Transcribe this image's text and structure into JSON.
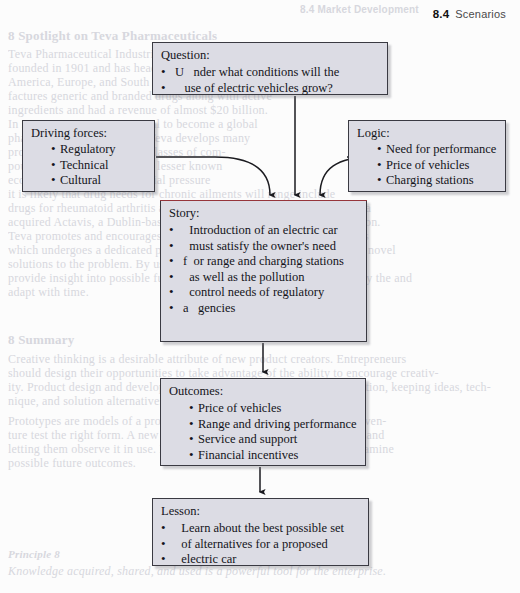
{
  "page": {
    "running_head": {
      "number": "8.4",
      "title": "Scenarios"
    },
    "background_color": "#fcfcfc",
    "node_fill_color": "#dcdce4",
    "node_border_color": "#3a3a42",
    "accent_rule_color": "#b5343a"
  },
  "diagram": {
    "type": "flowchart",
    "nodes": [
      {
        "id": "question",
        "title": "Question:",
        "lines": [
          "U   nder what conditions will the",
          "   use of electric vehicles grow?"
        ]
      },
      {
        "id": "driving-forces",
        "title": "Driving forces:",
        "bullets": [
          "Regulatory",
          "Technical",
          "Cultural"
        ]
      },
      {
        "id": "logic",
        "title": "Logic:",
        "bullets": [
          "Need for performance",
          "Price of vehicles",
          "Charging stations"
        ]
      },
      {
        "id": "story",
        "title": "Story:",
        "lines": [
          "  Introduction of an electric car",
          "  must satisfy the owner's need",
          "f  or range and charging stations",
          "  as well as the pollution",
          "  control needs of regulatory",
          "a   gencies"
        ]
      },
      {
        "id": "outcomes",
        "title": "Outcomes:",
        "bullets": [
          "Price of vehicles",
          "Range and driving performance",
          "Service and support",
          "Financial incentives"
        ]
      },
      {
        "id": "lesson",
        "title": "Lesson:",
        "lines": [
          "  Learn about the best possible set",
          "  of alternatives for a proposed",
          "  electric car"
        ]
      }
    ],
    "edges": [
      {
        "from": "question",
        "to": "story",
        "style": "straight-arrow-down"
      },
      {
        "from": "driving-forces",
        "to": "story",
        "style": "curved-arrow-right-down"
      },
      {
        "from": "logic",
        "to": "story",
        "style": "curved-arrow-left-down"
      },
      {
        "from": "story",
        "to": "outcomes",
        "style": "straight-arrow-down"
      },
      {
        "from": "outcomes",
        "to": "lesson",
        "style": "straight-arrow-down"
      }
    ]
  },
  "ghost_text": {
    "note": "faint show-through text from the underlying printed page",
    "items": [
      {
        "text": "8.4  Market Development",
        "x": 300,
        "y": 4,
        "size": 10,
        "cls": "ghost sans bold"
      },
      {
        "text": "8 Spotlight on Teva Pharmaceuticals",
        "x": 8,
        "y": 28,
        "size": 13,
        "cls": "ghost bold"
      },
      {
        "text": "Teva Pharmaceutical Industries Ltd. is a pharmaceutical company",
        "x": 8,
        "y": 47,
        "size": 12,
        "cls": "ghost"
      },
      {
        "text": "founded in 1901 and has headquarters in Israel, North",
        "x": 8,
        "y": 61,
        "size": 12,
        "cls": "ghost"
      },
      {
        "text": "America, Europe, and South America. Teva develops, manu-",
        "x": 8,
        "y": 75,
        "size": 12,
        "cls": "ghost"
      },
      {
        "text": "factures generic and branded drugs along with active",
        "x": 8,
        "y": 89,
        "size": 12,
        "cls": "ghost"
      },
      {
        "text": "ingredients and had a revenue of almost $20 billion.",
        "x": 8,
        "y": 103,
        "size": 12,
        "cls": "ghost"
      },
      {
        "text": "In 2013 Teva was given a goal to become a global",
        "x": 8,
        "y": 117,
        "size": 12,
        "cls": "ghost"
      },
      {
        "text": "pharmaceutical firm. While Teva develops many",
        "x": 8,
        "y": 131,
        "size": 12,
        "cls": "ghost"
      },
      {
        "text": "products, its focus is across classes of com-",
        "x": 8,
        "y": 145,
        "size": 12,
        "cls": "ghost"
      },
      {
        "text": "pounds promoting profitable, lesser known",
        "x": 8,
        "y": 159,
        "size": 12,
        "cls": "ghost"
      },
      {
        "text": "economic stresses and financial pressure",
        "x": 8,
        "y": 173,
        "size": 12,
        "cls": "ghost"
      },
      {
        "text": "it is likely that drug needs for chronic ailments will range include",
        "x": 8,
        "y": 187,
        "size": 12,
        "cls": "ghost"
      },
      {
        "text": "drugs for rheumatoid arthritis and for Alzheimer's disease. In 2015, Teva",
        "x": 8,
        "y": 201,
        "size": 12,
        "cls": "ghost"
      },
      {
        "text": "acquired Actavis, a Dublin-based generic drug maker, for over $40 billion.",
        "x": 8,
        "y": 215,
        "size": 12,
        "cls": "ghost"
      },
      {
        "text": "Teva promotes and encourages innovation. A major part of innovation is",
        "x": 8,
        "y": 229,
        "size": 12,
        "cls": "ghost"
      },
      {
        "text": "which undergoes a dedicated process of screening ideas to try to design novel",
        "x": 8,
        "y": 243,
        "size": 12,
        "cls": "ghost"
      },
      {
        "text": "solutions to the problem. By using scenarios and using scenarios that",
        "x": 8,
        "y": 257,
        "size": 12,
        "cls": "ghost"
      },
      {
        "text": "provide insight into possible future directions, Teva has been able to stay the and",
        "x": 8,
        "y": 271,
        "size": 12,
        "cls": "ghost"
      },
      {
        "text": "adapt with time.",
        "x": 8,
        "y": 285,
        "size": 12,
        "cls": "ghost"
      },
      {
        "text": "8 Summary",
        "x": 8,
        "y": 332,
        "size": 13,
        "cls": "ghost bold"
      },
      {
        "text": "Creative thinking is a desirable attribute of new product creators. Entrepreneurs",
        "x": 8,
        "y": 352,
        "size": 12,
        "cls": "ghost"
      },
      {
        "text": "should design their opportunities to take advantage of the ability to encourage creativ-",
        "x": 8,
        "y": 366,
        "size": 12,
        "cls": "ghost"
      },
      {
        "text": "ity. Product design and development processes are aided by idea generation, keeping ideas, tech-",
        "x": 8,
        "y": 380,
        "size": 12,
        "cls": "ghost"
      },
      {
        "text": "nique, and solution alternatives.",
        "x": 8,
        "y": 394,
        "size": 12,
        "cls": "ghost"
      },
      {
        "text": "Prototypes are models of a product or service, and they can help a new ven-",
        "x": 8,
        "y": 414,
        "size": 12,
        "cls": "ghost"
      },
      {
        "text": "ture test the right form. A new product prototype allows it to customers and",
        "x": 8,
        "y": 428,
        "size": 12,
        "cls": "ghost"
      },
      {
        "text": "letting them observe it in use. Furthermore, scenarios can be used to examine",
        "x": 8,
        "y": 442,
        "size": 12,
        "cls": "ghost"
      },
      {
        "text": "possible future outcomes.",
        "x": 8,
        "y": 456,
        "size": 12,
        "cls": "ghost"
      },
      {
        "text": "Principle 8",
        "x": 8,
        "y": 548,
        "size": 11,
        "cls": "ghost bold ital"
      },
      {
        "text": "Knowledge acquired, shared, and used is a powerful tool for the enterprise.",
        "x": 8,
        "y": 564,
        "size": 12,
        "cls": "ghost ital"
      }
    ]
  }
}
